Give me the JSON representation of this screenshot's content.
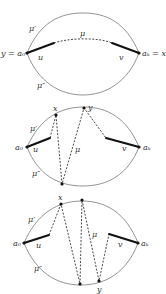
{
  "figure": {
    "colors": {
      "outline": "#777777",
      "path": "#111111",
      "dashed": "#333333",
      "text": "#333333"
    },
    "panels": [
      {
        "id": "panel-1",
        "labels": {
          "left_endpoint": "y = a₀",
          "right_endpoint": "aₖ = x",
          "upper_arc": "μ′",
          "lower_arc": "μ″",
          "path": "μ",
          "left_segment": "u",
          "right_segment": "v"
        }
      },
      {
        "id": "panel-2",
        "labels": {
          "left_endpoint": "a₀",
          "right_endpoint": "aₖ",
          "upper_arc": "μ′",
          "lower_arc": "μ″",
          "path": "μ",
          "left_segment": "u",
          "right_segment": "v",
          "point_x": "x",
          "point_y": "y"
        }
      },
      {
        "id": "panel-3",
        "labels": {
          "left_endpoint": "a₀",
          "right_endpoint": "aₖ",
          "upper_arc": "μ′",
          "lower_arc": "μ″",
          "path": "μ",
          "left_segment": "u",
          "right_segment": "v",
          "point_x": "x",
          "point_y": "y"
        }
      }
    ]
  }
}
